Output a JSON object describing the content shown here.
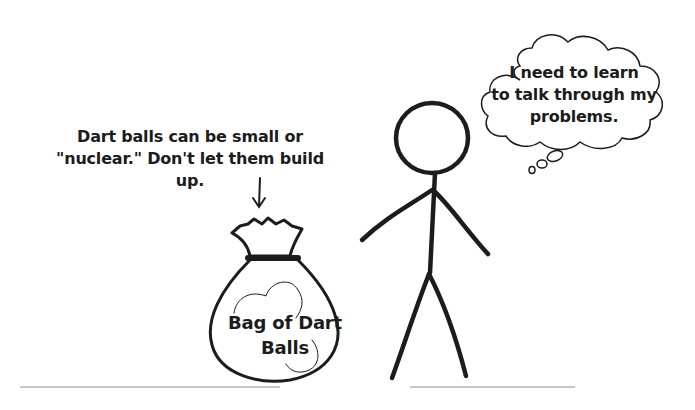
{
  "annotation": {
    "text": "Dart balls can be small or\n\"nuclear.\"  Don't let them build up."
  },
  "thought_bubble": {
    "text": "I need to learn\nto talk through my\nproblems."
  },
  "bag": {
    "label": "Bag of Dart\nBalls"
  },
  "colors": {
    "ink": "#1c1c1c",
    "background": "#ffffff"
  }
}
